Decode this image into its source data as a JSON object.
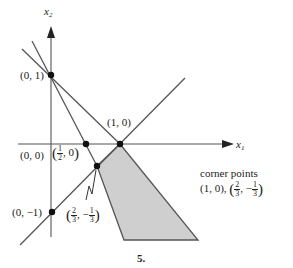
{
  "figure": {
    "number_label": "5.",
    "axes": {
      "x_label": "x",
      "x_sub": "1",
      "y_label": "x",
      "y_sub": "2"
    },
    "points": {
      "p01": "(0, 1)",
      "p10": "(1, 0)",
      "p00": "(0, 0)",
      "half": {
        "open": "(",
        "num": "1",
        "den": "2",
        "rest": ", 0",
        "close": ")"
      },
      "p0m1": "(0, −1)",
      "twothirds": {
        "open": "(",
        "num1": "2",
        "den1": "3",
        "sep": ", −",
        "num2": "1",
        "den2": "3",
        "close": ")"
      }
    },
    "annotation": {
      "title": "corner points",
      "line_prefix": "(1, 0), ",
      "open": "(",
      "num1": "2",
      "den1": "3",
      "sep": ", −",
      "num2": "1",
      "den2": "3",
      "close": ")"
    },
    "colors": {
      "line": "#555555",
      "shade": "#cfcfcf",
      "point": "#111111"
    }
  }
}
